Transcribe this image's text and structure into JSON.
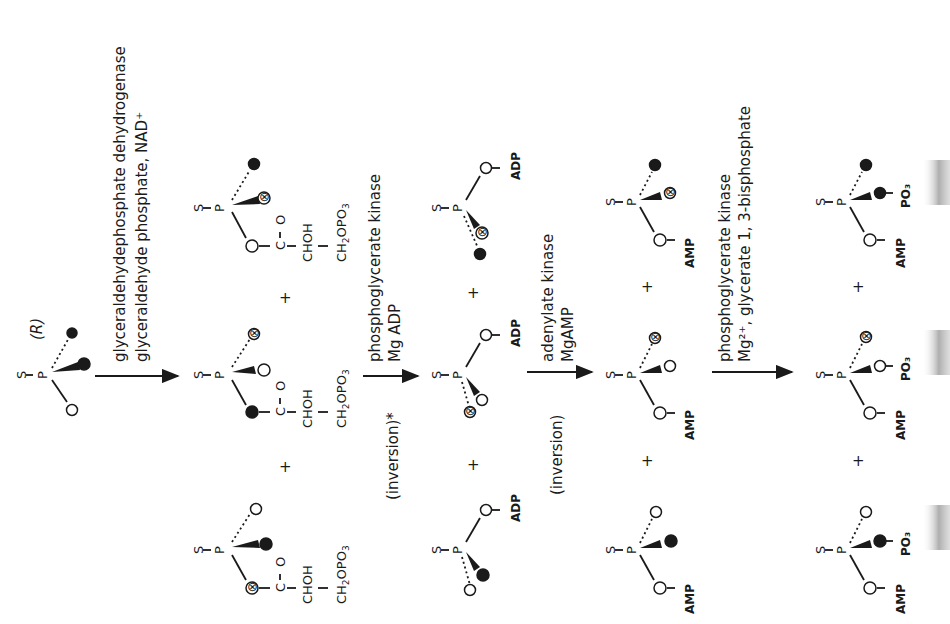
{
  "figure": {
    "configuration_label": "(R)",
    "orientation": "rotated -90deg (text reads bottom-to-top)"
  },
  "steps": [
    {
      "enzyme": "glyceraldehydephosphate dehydrogenase",
      "cofactor": "glyceraldehyde phosphate, NAD⁺",
      "note": ""
    },
    {
      "enzyme": "phosphoglycerate kinase",
      "cofactor": "Mg ADP",
      "note": "(inversion)*"
    },
    {
      "enzyme": "adenylate kinase",
      "cofactor": "MgAMP",
      "note": "(inversion)"
    },
    {
      "enzyme": "phosphoglycerate kinase",
      "cofactor": "Mg²⁺, glycerate 1, 3-bisphosphate",
      "note": ""
    }
  ],
  "atoms": {
    "S": "S",
    "P": "P",
    "C": "C",
    "O": "O",
    "CHOH": "CHOH",
    "CH2OPO3": "CH₂OPO₃",
    "ADP": "ADP",
    "AMP": "AMP",
    "PO3": "PO₃"
  },
  "legend": {
    "filled_circle": "18O (filled)",
    "crossed_circle": "17O (cross-marked)",
    "open_circle": "16O (open)"
  },
  "plus": "+"
}
